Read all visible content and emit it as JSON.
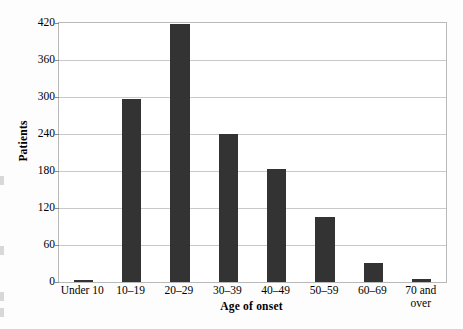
{
  "chart_data": {
    "type": "bar",
    "title": "",
    "xlabel": "Age of onset",
    "ylabel": "Patients",
    "categories": [
      "Under 10",
      "10–19",
      "20–29",
      "30–39",
      "40–49",
      "50–59",
      "60–69",
      "70 and\nover"
    ],
    "values": [
      3,
      297,
      418,
      240,
      183,
      105,
      31,
      5
    ],
    "ylim": [
      0,
      420
    ],
    "yticks": [
      0,
      60,
      120,
      180,
      240,
      300,
      360,
      420
    ],
    "ytick_labels": [
      "0",
      "60",
      "120",
      "180",
      "240",
      "300",
      "360",
      "420"
    ],
    "grid": true,
    "legend": false,
    "bar_color": "#333333",
    "gridline_color": "#c9c9c9",
    "plot_border_color": "#b9b9b9",
    "background_color": "#ffffff"
  }
}
